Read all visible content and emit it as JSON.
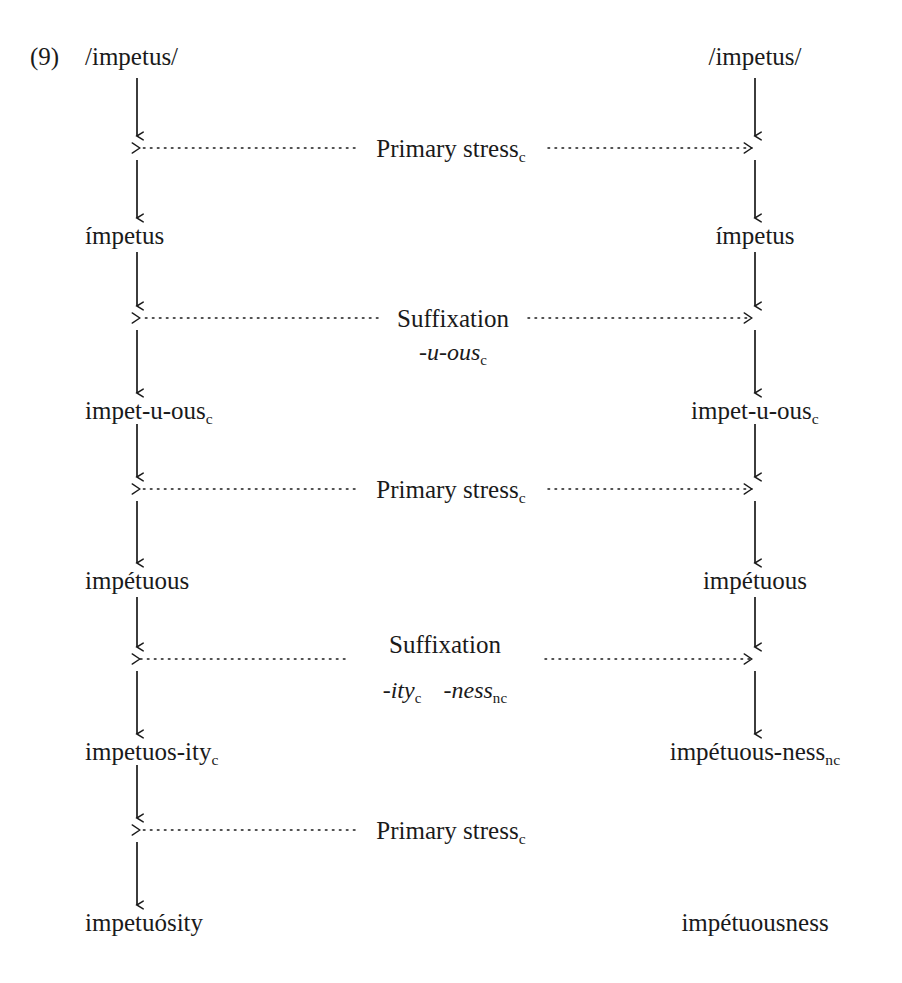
{
  "example": {
    "number": "(9)"
  },
  "colors": {
    "ink": "#1a1a1a",
    "background": "#ffffff"
  },
  "columns": {
    "left": {
      "name": "cyclic-derivation",
      "axis_x": 137,
      "text_x": 85
    },
    "right": {
      "name": "noncyclic-derivation",
      "axis_x": 755,
      "text_x": 755
    }
  },
  "forms": {
    "left": [
      {
        "id": "left-input",
        "text": "/impetus/",
        "y": 57
      },
      {
        "id": "left-impetus",
        "text": "ímpetus",
        "y": 236
      },
      {
        "id": "left-impet-u-ous",
        "text": "impet-u-ous",
        "sub": "c",
        "y": 411
      },
      {
        "id": "left-impetuous",
        "text": "impétuous",
        "y": 581
      },
      {
        "id": "left-impetuos-ity",
        "text": "impetuos-ity",
        "sub": "c",
        "y": 752
      },
      {
        "id": "left-impetuosity",
        "text": "impetuósity",
        "y": 923
      }
    ],
    "right": [
      {
        "id": "right-input",
        "text": "/impetus/",
        "y": 57
      },
      {
        "id": "right-impetus",
        "text": "ímpetus",
        "y": 236
      },
      {
        "id": "right-impet-u-ous",
        "text": "impet-u-ous",
        "sub": "c",
        "y": 411
      },
      {
        "id": "right-impetuous",
        "text": "impétuous",
        "y": 581
      },
      {
        "id": "right-impetuous-ness",
        "text": "impétuous-ness",
        "sub": "nc",
        "y": 752
      },
      {
        "id": "right-impetuousness",
        "text": "impétuousness",
        "y": 923
      }
    ]
  },
  "rules": [
    {
      "id": "rule-primary-stress-1",
      "label": "Primary stress",
      "sub": "c",
      "y": 148,
      "affixes": [],
      "spans_right": true,
      "label_inline": true
    },
    {
      "id": "rule-suffixation-1",
      "label": "Suffixation",
      "sub": "",
      "y": 318,
      "affixes": [
        {
          "text": "-u-ous",
          "sub": "c"
        }
      ],
      "spans_right": true,
      "label_inline": true
    },
    {
      "id": "rule-primary-stress-2",
      "label": "Primary stress",
      "sub": "c",
      "y": 489,
      "affixes": [],
      "spans_right": true,
      "label_inline": true
    },
    {
      "id": "rule-suffixation-2",
      "label": "Suffixation",
      "sub": "",
      "y": 659,
      "affixes": [
        {
          "text": "-ity",
          "sub": "c"
        },
        {
          "text": "-ness",
          "sub": "nc"
        }
      ],
      "spans_right": true,
      "label_inline": false
    },
    {
      "id": "rule-primary-stress-3",
      "label": "Primary stress",
      "sub": "c",
      "y": 830,
      "affixes": [],
      "spans_right": false,
      "label_inline": true
    }
  ],
  "labels": {
    "rule_1_text": "Primary stress",
    "rule_1_sub": "c",
    "rule_2_text": "Suffixation",
    "rule_2_affix": "-u-ous",
    "rule_2_affix_sub": "c",
    "rule_3_text": "Primary stress",
    "rule_3_sub": "c",
    "rule_4_text": "Suffixation",
    "rule_4_affix_a": "-ity",
    "rule_4_affix_a_sub": "c",
    "rule_4_affix_b": "-ness",
    "rule_4_affix_b_sub": "nc",
    "rule_5_text": "Primary stress",
    "rule_5_sub": "c"
  }
}
